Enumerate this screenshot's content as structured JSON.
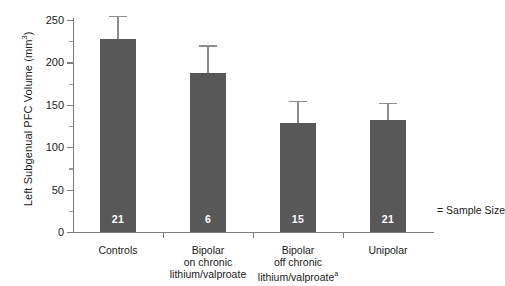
{
  "chart_data": {
    "type": "bar",
    "title": "",
    "subtitle": "",
    "xlabel": "",
    "ylabel": "Left Subgenual PFC Volume (mm",
    "ylabel_superscript": "3",
    "ylabel_suffix": ")",
    "ylim": [
      0,
      250
    ],
    "yticks": [
      0,
      50,
      100,
      150,
      200,
      250
    ],
    "ytick_labels": [
      "0",
      "50",
      "100",
      "150",
      "200",
      "250"
    ],
    "yminor_ticks": [
      25,
      75,
      125,
      175,
      225
    ],
    "grid": false,
    "legend_position": "right-inside",
    "categories": [
      "Controls",
      "Bipolar on chronic lithium/valproate",
      "Bipolar off chronic lithium/valproate",
      "Unipolar"
    ],
    "category_lines": [
      [
        "Controls"
      ],
      [
        "Bipolar",
        "on chronic",
        "lithium/valproate"
      ],
      [
        "Bipolar",
        "off chronic",
        "lithium/valproate"
      ],
      [
        "Unipolar"
      ]
    ],
    "category_footnote_marks": [
      "",
      "",
      "a",
      ""
    ],
    "values": [
      228,
      187,
      128,
      132
    ],
    "error_upper": [
      27,
      33,
      27,
      20
    ],
    "sample_sizes": [
      "21",
      "6",
      "15",
      "21"
    ],
    "bar_color": "#575857",
    "error_bar_color": "#8d8d8d",
    "axis_color": "#7e7e7e",
    "sample_size_note": "= Sample Size"
  }
}
